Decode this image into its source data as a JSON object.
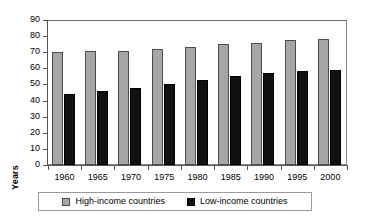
{
  "chart_data": {
    "type": "bar",
    "title": "",
    "xlabel": "",
    "ylabel": "Years",
    "ylim": [
      0,
      90
    ],
    "yticks": [
      0,
      10,
      20,
      30,
      40,
      50,
      60,
      70,
      80,
      90
    ],
    "grid": false,
    "legend_position": "bottom",
    "categories": [
      "1960",
      "1965",
      "1970",
      "1975",
      "1980",
      "1985",
      "1990",
      "1995",
      "2000"
    ],
    "series": [
      {
        "name": "High-income countries",
        "color": "#a6a6a6",
        "values": [
          70,
          70.5,
          71,
          72,
          73,
          75,
          76,
          77.5,
          78
        ]
      },
      {
        "name": "Low-income countries",
        "color": "#111111",
        "values": [
          44,
          46,
          48,
          50.5,
          52.5,
          55,
          57,
          58.5,
          59
        ]
      }
    ]
  },
  "axes": {
    "y_title": "Years"
  },
  "legend": {
    "items": [
      {
        "label": "High-income countries",
        "swatch": "gray-swatch-icon"
      },
      {
        "label": "Low-income countries",
        "swatch": "black-swatch-icon"
      }
    ]
  }
}
